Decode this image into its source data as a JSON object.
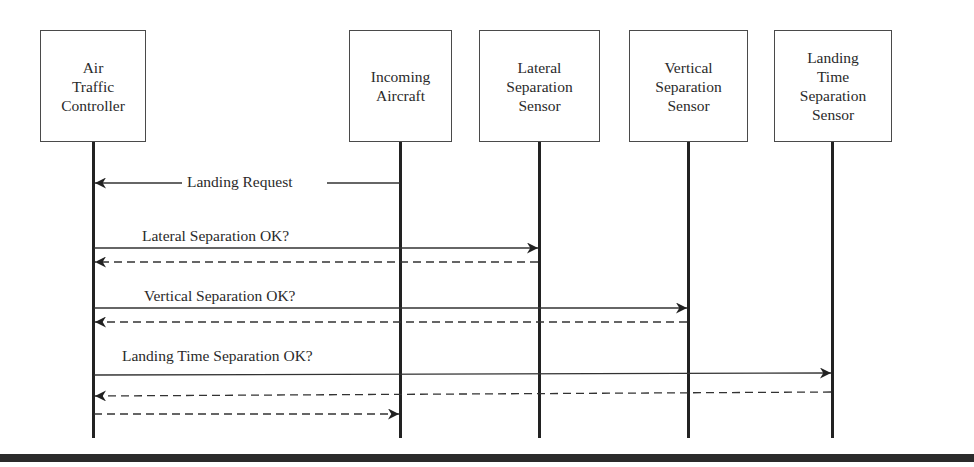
{
  "diagram": {
    "type": "sequence",
    "actors": [
      {
        "id": "atc",
        "lines": [
          "Air",
          "Traffic",
          "Controller"
        ]
      },
      {
        "id": "aircraft",
        "lines": [
          "Incoming",
          "Aircraft"
        ]
      },
      {
        "id": "lateral",
        "lines": [
          "Lateral",
          "Separation",
          "Sensor"
        ]
      },
      {
        "id": "vertical",
        "lines": [
          "Vertical",
          "Separation",
          "Sensor"
        ]
      },
      {
        "id": "landing_time",
        "lines": [
          "Landing",
          "Time",
          "Separation",
          "Sensor"
        ]
      }
    ],
    "messages": [
      {
        "from": "aircraft",
        "to": "atc",
        "label": "Landing Request",
        "style": "solid"
      },
      {
        "from": "atc",
        "to": "lateral",
        "label": "Lateral Separation OK?",
        "style": "solid"
      },
      {
        "from": "lateral",
        "to": "atc",
        "label": "",
        "style": "dashed"
      },
      {
        "from": "atc",
        "to": "vertical",
        "label": "Vertical Separation OK?",
        "style": "solid"
      },
      {
        "from": "vertical",
        "to": "atc",
        "label": "",
        "style": "dashed"
      },
      {
        "from": "atc",
        "to": "landing_time",
        "label": "Landing Time Separation OK?",
        "style": "solid"
      },
      {
        "from": "landing_time",
        "to": "atc",
        "label": "",
        "style": "dashed"
      },
      {
        "from": "atc",
        "to": "aircraft",
        "label": "",
        "style": "dashed"
      }
    ]
  }
}
